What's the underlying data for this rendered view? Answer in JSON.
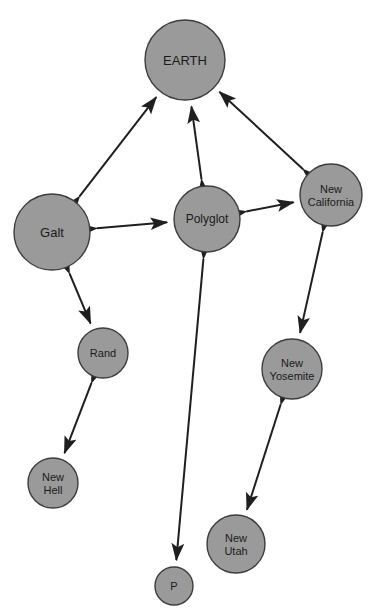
{
  "diagram": {
    "title_partial": "",
    "background_color": "#ffffff",
    "node_fill": "#9a9a9a",
    "node_stroke": "#3d3d3d",
    "edge_color": "#1f1f1f",
    "label_color": "#1a1a1a",
    "width": 376,
    "height": 613
  },
  "chart_data": {
    "type": "diagram",
    "layout": "node-link network graph",
    "title": "",
    "nodes": [
      {
        "id": "earth",
        "label": "EARTH",
        "lines": [
          "EARTH"
        ],
        "cx": 185,
        "cy": 60,
        "r": 40,
        "font_size": 13
      },
      {
        "id": "galt",
        "label": "Galt",
        "lines": [
          "Galt"
        ],
        "cx": 52,
        "cy": 232,
        "r": 38,
        "font_size": 13
      },
      {
        "id": "polyglot",
        "label": "Polyglot",
        "lines": [
          "Polyglot"
        ],
        "cx": 207,
        "cy": 219,
        "r": 33,
        "font_size": 12
      },
      {
        "id": "new-california",
        "label": "New California",
        "lines": [
          "New",
          "California"
        ],
        "cx": 331,
        "cy": 195,
        "r": 31,
        "font_size": 11
      },
      {
        "id": "rand",
        "label": "Rand",
        "lines": [
          "Rand"
        ],
        "cx": 103,
        "cy": 353,
        "r": 25,
        "font_size": 11
      },
      {
        "id": "new-yosemite",
        "label": "New Yosemite",
        "lines": [
          "New",
          "Yosemite"
        ],
        "cx": 292,
        "cy": 369,
        "r": 30,
        "font_size": 11
      },
      {
        "id": "new-hell",
        "label": "New Hell",
        "lines": [
          "New",
          "Hell"
        ],
        "cx": 53,
        "cy": 483,
        "r": 25,
        "font_size": 11
      },
      {
        "id": "new-utah",
        "label": "New Utah",
        "lines": [
          "New",
          "Utah"
        ],
        "cx": 236,
        "cy": 544,
        "r": 29,
        "font_size": 11
      },
      {
        "id": "p",
        "label": "P",
        "lines": [
          "P"
        ],
        "cx": 174,
        "cy": 586,
        "r": 19,
        "font_size": 11
      }
    ],
    "edges": [
      {
        "source": "galt",
        "target": "earth",
        "directed": "both"
      },
      {
        "source": "polyglot",
        "target": "earth",
        "directed": "both"
      },
      {
        "source": "new-california",
        "target": "earth",
        "directed": "both"
      },
      {
        "source": "galt",
        "target": "polyglot",
        "directed": "both"
      },
      {
        "source": "galt",
        "target": "rand",
        "directed": "both"
      },
      {
        "source": "rand",
        "target": "new-hell",
        "directed": "both"
      },
      {
        "source": "polyglot",
        "target": "new-california",
        "directed": "both"
      },
      {
        "source": "polyglot",
        "target": "p",
        "directed": "both"
      },
      {
        "source": "new-california",
        "target": "new-yosemite",
        "directed": "both"
      },
      {
        "source": "new-yosemite",
        "target": "new-utah",
        "directed": "both"
      }
    ],
    "node_count": 9,
    "edge_count": 10,
    "legend": [],
    "xlabel": "",
    "ylabel": ""
  }
}
